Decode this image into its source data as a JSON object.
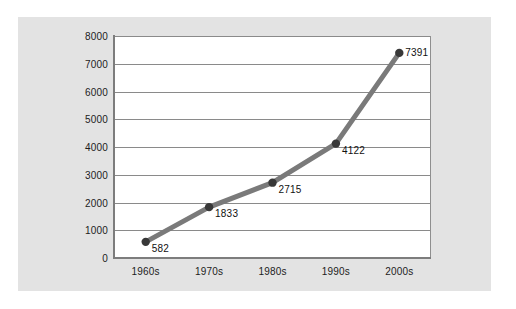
{
  "chart_data": {
    "type": "line",
    "title": "",
    "subtitle": "",
    "xlabel": "",
    "ylabel": "",
    "categories": [
      "1960s",
      "1970s",
      "1980s",
      "1990s",
      "2000s"
    ],
    "values": [
      582,
      1833,
      2715,
      4122,
      7391
    ],
    "point_labels": [
      "582",
      "1833",
      "2715",
      "4122",
      "7391"
    ],
    "y_ticks": [
      "0",
      "1000",
      "2000",
      "3000",
      "4000",
      "5000",
      "6000",
      "7000",
      "8000"
    ],
    "y_tick_values": [
      0,
      1000,
      2000,
      3000,
      4000,
      5000,
      6000,
      7000,
      8000
    ],
    "ylim": [
      0,
      8000
    ],
    "grid": "horizontal",
    "legend": "none",
    "series": [
      {
        "name": "",
        "values": [
          582,
          1833,
          2715,
          4122,
          7391
        ]
      }
    ],
    "colors": {
      "panel_background": "#e3e3e3",
      "plot_background": "#ffffff",
      "gridline": "#8a8a8a",
      "axis": "#7d7d7d",
      "line": "#7a7a7a",
      "marker": "#383838",
      "text": "#1c1c1c"
    }
  }
}
